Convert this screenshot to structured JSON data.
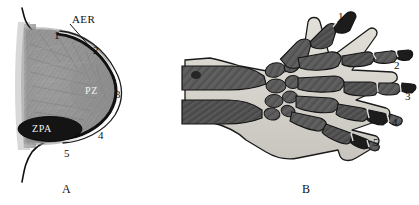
{
  "figure": {
    "background_color": "#ffffff",
    "width": 419,
    "height": 205
  },
  "panels": [
    {
      "id": "panel-a",
      "letter": "A",
      "caption_letter": "A",
      "description": "limb-bud-diagram",
      "text_labels": [
        {
          "name": "aer-label",
          "text": "AER",
          "x": 72,
          "y": 14
        },
        {
          "name": "pz-label",
          "text": "PZ",
          "x": 85,
          "y": 86,
          "color": "#f2f2f2"
        },
        {
          "name": "zpa-label",
          "text": "ZPA",
          "x": 32,
          "y": 126,
          "color": "#f2f2f2"
        }
      ],
      "numbers": [
        {
          "name": "region-1",
          "text": "1",
          "x": 54,
          "y": 30
        },
        {
          "name": "region-2",
          "text": "2",
          "x": 93,
          "y": 45
        },
        {
          "name": "region-3",
          "text": "3",
          "x": 115,
          "y": 89
        },
        {
          "name": "region-4",
          "text": "4",
          "x": 98,
          "y": 130
        },
        {
          "name": "region-5",
          "text": "5",
          "x": 64,
          "y": 148
        }
      ]
    },
    {
      "id": "panel-b",
      "letter": "B",
      "caption_letter": "B",
      "description": "hand-radiograph",
      "numbers": [
        {
          "name": "digit-1",
          "text": "1",
          "x": 338,
          "y": 12
        },
        {
          "name": "digit-2",
          "text": "2",
          "x": 394,
          "y": 62
        },
        {
          "name": "digit-3",
          "text": "3",
          "x": 404,
          "y": 94
        },
        {
          "name": "digit-4",
          "text": "4",
          "x": 391,
          "y": 119
        },
        {
          "name": "digit-5",
          "text": "5",
          "x": 372,
          "y": 138
        }
      ]
    }
  ],
  "colors": {
    "outline": "#111111",
    "mesenchyme_fill": "#8f8f8f",
    "zpa_fill": "#141414",
    "bone_dark": "#4a4a4a",
    "bone_mid": "#6e6e6e",
    "soft_tissue": "#d8d5cf",
    "background": "#ffffff"
  }
}
